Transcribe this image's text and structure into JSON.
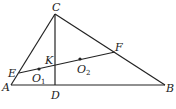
{
  "diagram": {
    "type": "geometry",
    "points": {
      "A": {
        "label": "A",
        "x": 11,
        "y": 85,
        "lx": 2,
        "ly": 91
      },
      "B": {
        "label": "B",
        "x": 165,
        "y": 85,
        "lx": 166,
        "ly": 92
      },
      "C": {
        "label": "C",
        "x": 55,
        "y": 14,
        "lx": 52,
        "ly": 11
      },
      "D": {
        "label": "D",
        "x": 55,
        "y": 85,
        "lx": 51,
        "ly": 99
      },
      "E": {
        "label": "E",
        "x": 19,
        "y": 73,
        "lx": 8,
        "ly": 77
      },
      "F": {
        "label": "F",
        "x": 115,
        "y": 52,
        "lx": 115,
        "ly": 51
      },
      "K": {
        "label": "K",
        "x": 55,
        "y": 66,
        "lx": 45,
        "ly": 64
      },
      "O1": {
        "label": "O",
        "sub": "1",
        "x": 39,
        "y": 69,
        "lx": 32,
        "ly": 82
      },
      "O2": {
        "label": "O",
        "sub": "2",
        "x": 80,
        "y": 59,
        "lx": 77,
        "ly": 73
      }
    },
    "segments": [
      [
        "A",
        "B"
      ],
      [
        "B",
        "C"
      ],
      [
        "C",
        "A"
      ],
      [
        "C",
        "D"
      ],
      [
        "E",
        "F"
      ]
    ],
    "dots": [
      "O1",
      "O2"
    ]
  }
}
